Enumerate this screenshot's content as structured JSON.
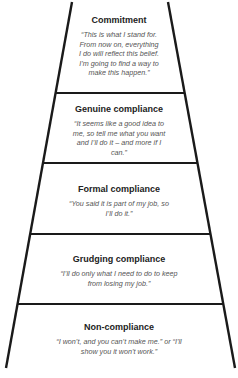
{
  "diagram": {
    "type": "ladder",
    "tiers": [
      {
        "title": "Commitment",
        "quote": "“This is what I stand for. From now on, everything I do will reflect this belief. I’m going to find a way to make this happen.”"
      },
      {
        "title": "Genuine compliance",
        "quote": "“It seems like a good idea to me, so tell me what you want and I’ll do it – and more if I can.”"
      },
      {
        "title": "Formal compliance",
        "quote": "“You said it is part of my job, so I’ll do it.”"
      },
      {
        "title": "Grudging compliance",
        "quote": "“I’ll do only what I need to do to keep from losing my job.”"
      },
      {
        "title": "Non-compliance",
        "quote": "“I won’t, and you can’t make me.” or “I’ll show you it won’t work.”"
      }
    ],
    "colors": {
      "line": "#1a1a1a",
      "title": "#222222",
      "quote": "#555555",
      "background": "#ffffff"
    }
  }
}
